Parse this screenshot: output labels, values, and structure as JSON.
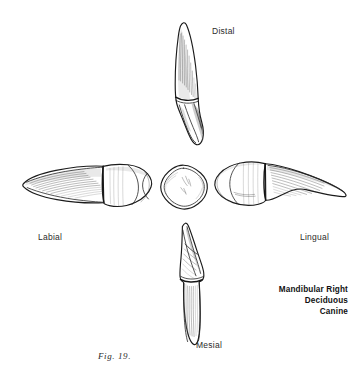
{
  "figure": {
    "number": "Fig. 19.",
    "caption_lines": [
      "Mandibular Right",
      "Deciduous",
      "Canine"
    ],
    "background_color": "#ffffff",
    "ink_color": "#1b1b1b"
  },
  "views": {
    "distal": {
      "label": "Distal",
      "icon": "tooth-distal-view-icon"
    },
    "labial": {
      "label": "Labial",
      "icon": "tooth-labial-view-icon"
    },
    "lingual": {
      "label": "Lingual",
      "icon": "tooth-lingual-view-icon"
    },
    "mesial": {
      "label": "Mesial",
      "icon": "tooth-mesial-view-icon"
    },
    "incisal": {
      "label": "",
      "icon": "tooth-incisal-view-icon"
    }
  }
}
